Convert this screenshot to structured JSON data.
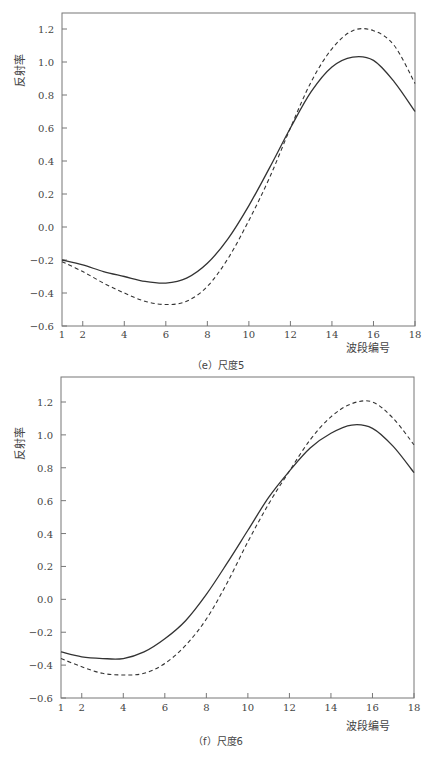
{
  "chart_data": [
    {
      "type": "line",
      "title": "(e) 尺度5",
      "xlabel": "波段编号",
      "ylabel": "反射率",
      "xlim": [
        1,
        18
      ],
      "ylim": [
        -0.6,
        1.3
      ],
      "xticks": [
        "1",
        "2",
        "4",
        "6",
        "8",
        "10",
        "12",
        "14",
        "16",
        "18"
      ],
      "yticks": [
        "1.2",
        "1.0",
        "0.8",
        "0.6",
        "0.4",
        "0.2",
        "0.0",
        "−0.2",
        "−0.4",
        "−0.6"
      ],
      "grid": false,
      "legend": "none",
      "x": [
        1,
        2,
        3,
        4,
        5,
        6,
        7,
        8,
        9,
        10,
        11,
        12,
        13,
        14,
        15,
        16,
        17,
        18
      ],
      "series": [
        {
          "name": "solid",
          "style": "solid",
          "values": [
            -0.2,
            -0.23,
            -0.27,
            -0.3,
            -0.33,
            -0.34,
            -0.31,
            -0.22,
            -0.07,
            0.13,
            0.36,
            0.6,
            0.82,
            0.97,
            1.03,
            1.01,
            0.88,
            0.7
          ]
        },
        {
          "name": "dashed",
          "style": "dashed",
          "values": [
            -0.21,
            -0.27,
            -0.34,
            -0.4,
            -0.45,
            -0.47,
            -0.45,
            -0.36,
            -0.19,
            0.04,
            0.3,
            0.6,
            0.88,
            1.08,
            1.19,
            1.19,
            1.1,
            0.87
          ]
        }
      ]
    },
    {
      "type": "line",
      "title": "(f) 尺度6",
      "xlabel": "波段编号",
      "ylabel": "反射率",
      "xlim": [
        1,
        18
      ],
      "ylim": [
        -0.6,
        1.3
      ],
      "xticks": [
        "1",
        "2",
        "4",
        "6",
        "8",
        "10",
        "12",
        "14",
        "16",
        "18"
      ],
      "yticks": [
        "1.2",
        "1.0",
        "0.8",
        "0.6",
        "0.4",
        "0.2",
        "0.0",
        "−0.2",
        "−0.4",
        "−0.6"
      ],
      "grid": false,
      "legend": "none",
      "x": [
        1,
        2,
        3,
        4,
        5,
        6,
        7,
        8,
        9,
        10,
        11,
        12,
        13,
        14,
        15,
        16,
        17,
        18
      ],
      "series": [
        {
          "name": "solid",
          "style": "solid",
          "values": [
            -0.32,
            -0.35,
            -0.36,
            -0.36,
            -0.32,
            -0.24,
            -0.13,
            0.03,
            0.22,
            0.42,
            0.62,
            0.78,
            0.92,
            1.01,
            1.06,
            1.04,
            0.93,
            0.77
          ]
        },
        {
          "name": "dashed",
          "style": "dashed",
          "values": [
            -0.36,
            -0.41,
            -0.45,
            -0.46,
            -0.45,
            -0.39,
            -0.28,
            -0.12,
            0.1,
            0.35,
            0.58,
            0.78,
            0.97,
            1.11,
            1.19,
            1.2,
            1.1,
            0.94
          ]
        }
      ]
    }
  ],
  "charts": [
    {
      "caption": "（e）尺度5",
      "xlabel": "波段编号",
      "ylabel": "反射率"
    },
    {
      "caption": "（f）尺度6",
      "xlabel": "波段编号",
      "ylabel": "反射率"
    }
  ]
}
